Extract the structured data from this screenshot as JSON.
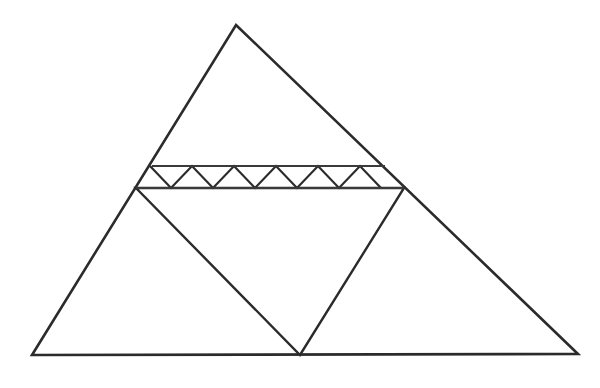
{
  "figure": {
    "kind": "geometry-diagram",
    "canvas": {
      "width": 600,
      "height": 388,
      "background": "#ffffff"
    },
    "colors": {
      "outline": "#2b2b2b",
      "inner": "#2b2b2b",
      "band_rail": "#3a3a3a",
      "zigzag": "#2b2b2b",
      "background": "#ffffff"
    },
    "stroke_widths": {
      "outer_triangle": 2.6,
      "inner_triangle": 2.4,
      "band_rail": 2.0,
      "zigzag": 2.2
    }
  },
  "chart_data": {
    "type": "line",
    "xlabel": "",
    "ylabel": "",
    "xlim": [
      0,
      600
    ],
    "ylim": [
      388,
      0
    ],
    "grid": false,
    "legend": "none",
    "shapes": [
      {
        "name": "outer-triangle",
        "role": "large outer triangle",
        "closed": true,
        "points": [
          [
            236,
            25
          ],
          [
            578,
            354
          ],
          [
            32,
            355
          ]
        ]
      },
      {
        "name": "inverted-triangle",
        "role": "inscribed downward-pointing triangle",
        "closed": true,
        "points": [
          [
            136,
            188
          ],
          [
            404,
            188
          ],
          [
            300,
            355
          ]
        ]
      },
      {
        "name": "band-upper-rail",
        "role": "upper horizontal rail of truss band",
        "closed": false,
        "points": [
          [
            152,
            166
          ],
          [
            385,
            166
          ]
        ]
      },
      {
        "name": "band-lower-rail",
        "role": "lower horizontal rail of truss band (shared with inverted triangle top)",
        "closed": false,
        "points": [
          [
            136,
            188
          ],
          [
            404,
            188
          ]
        ]
      },
      {
        "name": "zigzag-truss",
        "role": "sawtooth diagonal web between the two rails",
        "closed": false,
        "points": [
          [
            150,
            166
          ],
          [
            171,
            188
          ],
          [
            192,
            166
          ],
          [
            213,
            188
          ],
          [
            234,
            166
          ],
          [
            255,
            188
          ],
          [
            276,
            166
          ],
          [
            297,
            188
          ],
          [
            318,
            166
          ],
          [
            339,
            188
          ],
          [
            360,
            166
          ],
          [
            381,
            188
          ]
        ]
      }
    ],
    "vertices": [
      {
        "name": "apex",
        "label": "",
        "x": 236,
        "y": 25
      },
      {
        "name": "bottom-left",
        "label": "",
        "x": 32,
        "y": 355
      },
      {
        "name": "bottom-right",
        "label": "",
        "x": 578,
        "y": 354
      },
      {
        "name": "band-left-junction",
        "label": "",
        "x": 136,
        "y": 188
      },
      {
        "name": "band-right-junction",
        "label": "",
        "x": 404,
        "y": 188
      },
      {
        "name": "inverted-apex",
        "label": "",
        "x": 300,
        "y": 355
      },
      {
        "name": "band-upper-left",
        "label": "",
        "x": 152,
        "y": 166
      },
      {
        "name": "band-upper-right",
        "label": "",
        "x": 385,
        "y": 166
      }
    ],
    "counts": {
      "zigzag_peaks": 6,
      "zigzag_valleys": 6,
      "band_height_px": 22
    },
    "annotations": []
  }
}
